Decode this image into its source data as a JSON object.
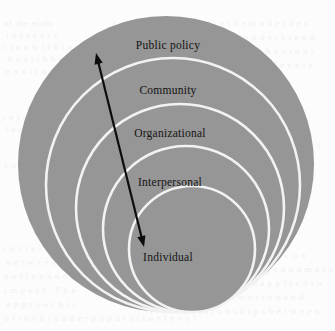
{
  "figure": {
    "type": "nested-circles-diagram",
    "canvas": {
      "width": 335,
      "height": 331
    },
    "colors": {
      "background": "#fcfcfc",
      "ring_fill": "#969696",
      "ring_separator": "#f2f2f2",
      "label_text": "#141414",
      "arrow": "#0d0d0d",
      "ghost_text": "#f0f0f0"
    },
    "rings": [
      {
        "label": "Public policy",
        "level": 1,
        "cx": 166,
        "cy": 164,
        "r": 148,
        "label_x": 168,
        "label_y": 45
      },
      {
        "label": "Community",
        "level": 2,
        "cx": 173,
        "cy": 185,
        "r": 127,
        "label_x": 168,
        "label_y": 90
      },
      {
        "label": "Organizational",
        "level": 3,
        "cx": 180,
        "cy": 208,
        "r": 104,
        "label_x": 170,
        "label_y": 133
      },
      {
        "label": "Interpersonal",
        "level": 4,
        "cx": 186,
        "cy": 229,
        "r": 83,
        "label_x": 170,
        "label_y": 182
      },
      {
        "label": "Individual",
        "level": 5,
        "cx": 192,
        "cy": 249,
        "r": 63,
        "label_x": 168,
        "label_y": 257
      }
    ],
    "arrow": {
      "name": "double-headed-arrow",
      "from_x": 96,
      "from_y": 53,
      "to_x": 144,
      "to_y": 247,
      "double_headed": true,
      "stroke_width": 2.2
    },
    "ghost_lines": [
      {
        "text": "of  the  ecolo",
        "x": 4,
        "y": 18
      },
      {
        "text": "i   n   t   e   r   a   c   t",
        "x": 6,
        "y": 30
      },
      {
        "text": "t i o n   w i t h i n",
        "x": 4,
        "y": 42
      },
      {
        "text": "h e a l t h   b e",
        "x": 8,
        "y": 54
      },
      {
        "text": "e n v i r o n",
        "x": 6,
        "y": 66
      },
      {
        "text": "r e l a t e d",
        "x": 3,
        "y": 112
      },
      {
        "text": "f a c t o r s",
        "x": 5,
        "y": 124
      },
      {
        "text": "c o m m u",
        "x": 4,
        "y": 160
      },
      {
        "text": "s o c i a l   n o r m",
        "x": 3,
        "y": 243
      },
      {
        "text": "b e t w e e n   t h e",
        "x": 6,
        "y": 257
      },
      {
        "text": "p o l i c y   a n d   t h e",
        "x": 4,
        "y": 271
      },
      {
        "text": "i m p a c t .   T h e",
        "x": 4,
        "y": 285
      },
      {
        "text": "a p p r o a c h   i s",
        "x": 6,
        "y": 299
      },
      {
        "text": "o f   t h e   b r o a d e r   p o p u l a t i o n   l e v e l",
        "x": 4,
        "y": 313
      },
      {
        "text": "s   a  r e   c o n s i d e r e d   i n   t h e   m o d e l   d e s",
        "x": 112,
        "y": 18
      },
      {
        "text": "e l   a n d   i s   u s e d   t o   u n d e r s t a n d",
        "x": 150,
        "y": 32
      },
      {
        "text": "i n f l u e n c e   o n   b e h a v i o u r",
        "x": 170,
        "y": 46
      },
      {
        "text": "t h e   m u l t i p l e   l e v e l s",
        "x": 195,
        "y": 60
      },
      {
        "text": "c h a n g e   i s   a",
        "x": 240,
        "y": 110
      },
      {
        "text": "e f f e c t i v e",
        "x": 262,
        "y": 140
      },
      {
        "text": "i n   t h e   c o n",
        "x": 250,
        "y": 250
      },
      {
        "text": "t o   s u p p o r t   c h a n g e   a n d   m a i n",
        "x": 170,
        "y": 264
      },
      {
        "text": "e   m o d e l   h a s   b e e n   a p p l i e d   t o",
        "x": 160,
        "y": 278
      },
      {
        "text": "n   o f   h e a l t h   p r o m o t i o n   a n d",
        "x": 150,
        "y": 292
      },
      {
        "text": "r   t h e   r e l a t i o n s h i p s   b e t w e e n",
        "x": 150,
        "y": 306
      }
    ]
  }
}
